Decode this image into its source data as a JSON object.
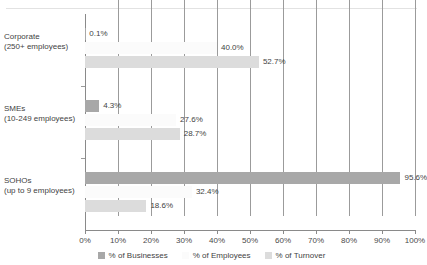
{
  "title_remnant": "",
  "chart_data": {
    "type": "bar",
    "orientation": "horizontal",
    "title": "",
    "xlabel": "",
    "ylabel": "",
    "xlim": [
      0,
      100
    ],
    "grid": true,
    "legend_position": "bottom",
    "categories": [
      "Corporate (250+ employees)",
      "SMEs (10-249 employees)",
      "SOHOs (up to 9 employees)"
    ],
    "category_lines": [
      [
        "Corporate",
        "(250+ employees)"
      ],
      [
        "SMEs",
        "(10-249 employees)"
      ],
      [
        "SOHOs",
        "(up to 9 employees)"
      ]
    ],
    "xticks": [
      "0%",
      "10%",
      "20%",
      "30%",
      "40%",
      "50%",
      "60%",
      "70%",
      "80%",
      "90%",
      "100%"
    ],
    "xtick_values": [
      0,
      10,
      20,
      30,
      40,
      50,
      60,
      70,
      80,
      90,
      100
    ],
    "series": [
      {
        "name": "% of Businesses",
        "color": "#a8a8a8",
        "values": [
          0.1,
          4.3,
          95.6
        ],
        "labels": [
          "0.1%",
          "4.3%",
          "95.6%"
        ]
      },
      {
        "name": "% of Employees",
        "color": "#fbfbfb",
        "values": [
          40.0,
          27.6,
          32.4
        ],
        "labels": [
          "40.0%",
          "27.6%",
          "32.4%"
        ]
      },
      {
        "name": "% of Turnover",
        "color": "#dcdcdc",
        "values": [
          52.7,
          28.7,
          18.6
        ],
        "labels": [
          "52.7%",
          "28.7%",
          "18.6%"
        ]
      }
    ]
  },
  "legend": {
    "items": [
      {
        "label": "% of Businesses",
        "color": "#a8a8a8"
      },
      {
        "label": "% of Employees",
        "color": "#fbfbfb"
      },
      {
        "label": "% of Turnover",
        "color": "#dcdcdc"
      }
    ]
  }
}
